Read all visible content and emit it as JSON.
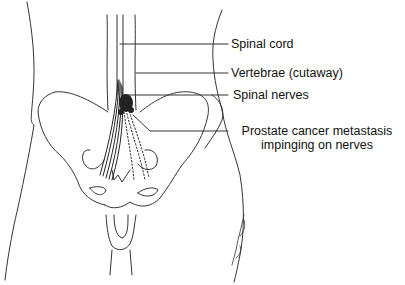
{
  "figure": {
    "ink_color": "#222222",
    "labels": [
      {
        "id": "spinal-cord",
        "text": "Spinal cord"
      },
      {
        "id": "vertebrae",
        "text": "Vertebrae (cutaway)"
      },
      {
        "id": "spinal-nerves",
        "text": "Spinal nerves"
      },
      {
        "id": "metastasis",
        "line1": "Prostate cancer metastasis",
        "line2": "impinging on nerves"
      }
    ],
    "signature": "artist signature"
  }
}
